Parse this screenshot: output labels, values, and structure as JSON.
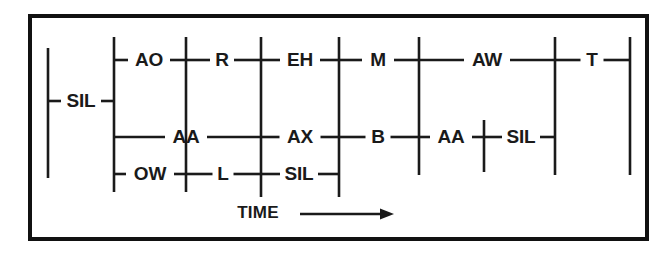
{
  "figure": {
    "type": "phonetic-lattice",
    "title": "",
    "axis": {
      "label": "TIME",
      "arrow": "right-arrow",
      "arrow_from_x": 300,
      "arrow_to_x": 394,
      "y": 214,
      "label_x": 258
    },
    "colors": {
      "ink": "#1a1a1a",
      "background": "#ffffff",
      "border": "#111111"
    },
    "frame": {
      "x": 30,
      "y": 16,
      "width": 617,
      "height": 223,
      "stroke_width": 4
    },
    "rows": {
      "top_y": 60,
      "middle_y": 137,
      "bottom_y": 174,
      "sil_y": 101
    },
    "nodes": [
      {
        "id": "n0",
        "x": 48,
        "y_top": 48,
        "y_bottom": 178
      },
      {
        "id": "n1",
        "x": 114,
        "y_top": 37,
        "y_bottom": 192
      },
      {
        "id": "n2",
        "x": 186,
        "y_top": 37,
        "y_bottom": 192
      },
      {
        "id": "n3",
        "x": 261,
        "y_top": 37,
        "y_bottom": 197
      },
      {
        "id": "n4",
        "x": 339,
        "y_top": 37,
        "y_bottom": 197
      },
      {
        "id": "n5",
        "x": 419,
        "y_top": 37,
        "y_bottom": 175
      },
      {
        "id": "n6",
        "x": 484,
        "y_top": 120,
        "y_bottom": 172
      },
      {
        "id": "n7",
        "x": 555,
        "y_top": 37,
        "y_bottom": 175
      },
      {
        "id": "n8",
        "x": 630,
        "y_top": 37,
        "y_bottom": 175
      }
    ],
    "arcs": [
      {
        "label": "SIL",
        "row": "sil",
        "x": 81,
        "y": 101,
        "x_from": 48,
        "x_to": 114,
        "label_w": 30
      },
      {
        "label": "AO",
        "row": "top",
        "x": 149,
        "y": 60,
        "x_from": 114,
        "x_to": 186,
        "label_w": 32
      },
      {
        "label": "R",
        "row": "top",
        "x": 222,
        "y": 60,
        "x_from": 186,
        "x_to": 261,
        "label_w": 14
      },
      {
        "label": "EH",
        "row": "top",
        "x": 300,
        "y": 60,
        "x_from": 261,
        "x_to": 339,
        "label_w": 30
      },
      {
        "label": "M",
        "row": "top",
        "x": 378,
        "y": 60,
        "x_from": 339,
        "x_to": 419,
        "label_w": 22
      },
      {
        "label": "AW",
        "row": "top",
        "x": 487,
        "y": 60,
        "x_from": 419,
        "x_to": 555,
        "label_w": 36
      },
      {
        "label": "T",
        "row": "top",
        "x": 592,
        "y": 60,
        "x_from": 555,
        "x_to": 630,
        "label_w": 13
      },
      {
        "label": "AA",
        "row": "middle",
        "x": 186,
        "y": 137,
        "x_from": 114,
        "x_to": 261,
        "label_w": 32
      },
      {
        "label": "AX",
        "row": "middle",
        "x": 300,
        "y": 137,
        "x_from": 261,
        "x_to": 339,
        "label_w": 31
      },
      {
        "label": "B",
        "row": "middle",
        "x": 378,
        "y": 137,
        "x_from": 339,
        "x_to": 419,
        "label_w": 15
      },
      {
        "label": "AA",
        "row": "middle",
        "x": 451,
        "y": 137,
        "x_from": 419,
        "x_to": 484,
        "label_w": 32
      },
      {
        "label": "SIL",
        "row": "middle",
        "x": 521,
        "y": 137,
        "x_from": 484,
        "x_to": 555,
        "label_w": 28
      },
      {
        "label": "OW",
        "row": "bottom",
        "x": 150,
        "y": 174,
        "x_from": 114,
        "x_to": 186,
        "label_w": 38
      },
      {
        "label": "L",
        "row": "bottom",
        "x": 223,
        "y": 174,
        "x_from": 186,
        "x_to": 261,
        "label_w": 11
      },
      {
        "label": "SIL",
        "row": "bottom",
        "x": 299,
        "y": 174,
        "x_from": 261,
        "x_to": 339,
        "label_w": 28
      }
    ],
    "legend": {
      "phones": [
        "SIL",
        "AO",
        "R",
        "EH",
        "M",
        "AW",
        "T",
        "AA",
        "AX",
        "B",
        "OW",
        "L"
      ]
    }
  }
}
